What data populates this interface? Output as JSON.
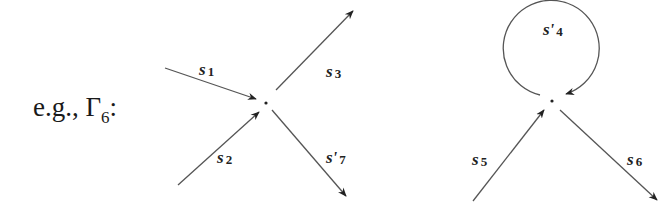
{
  "caption": {
    "prefix": "e.g., ",
    "symbol": "Γ",
    "subscript": "6",
    "suffix": ":"
  },
  "colors": {
    "line": "#444444",
    "text": "#1a1a1a"
  },
  "diagrams": [
    {
      "name": "vertex-left",
      "vertex": [
        266,
        103
      ],
      "edges": [
        {
          "label": "s",
          "index": "1",
          "prime": false,
          "direction": "in"
        },
        {
          "label": "s",
          "index": "2",
          "prime": false,
          "direction": "in"
        },
        {
          "label": "s",
          "index": "3",
          "prime": false,
          "direction": "out"
        },
        {
          "label": "s'",
          "index": "7",
          "prime": true,
          "direction": "out"
        }
      ]
    },
    {
      "name": "vertex-right",
      "vertex": [
        552,
        101
      ],
      "edges": [
        {
          "label": "s'",
          "index": "4",
          "prime": true,
          "direction": "loop"
        },
        {
          "label": "s",
          "index": "5",
          "prime": false,
          "direction": "in"
        },
        {
          "label": "s",
          "index": "6",
          "prime": false,
          "direction": "out"
        }
      ]
    }
  ]
}
